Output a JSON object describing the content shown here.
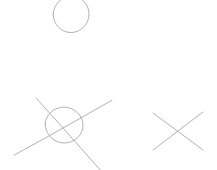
{
  "canvas": {
    "width": 217,
    "height": 170,
    "background_color": "#ffffff",
    "title": "Hand-drawn shapes sketch"
  },
  "style": {
    "stroke_color": "#a8a8ae",
    "stroke_color_light": "#b6b6bc",
    "stroke_width": 0.9
  },
  "shapes": [
    {
      "id": "top-circle",
      "name": "circle",
      "label": "Circle (clipped at top edge)",
      "cx": 71,
      "cy": 14,
      "rx": 18,
      "ry": 18.5,
      "path": "M 53.2 14.5 C 53.4 4.6 61.5 -3.7 71.2 -3.9 C 80.8 -4.1 88.8 3.9 89.0 13.7 C 89.2 23.6 81.3 32.1 71.6 32.5 C 61.8 32.9 53.4 25.0 53.2 14.5 Z"
    },
    {
      "id": "crossed-circle",
      "name": "circle-with-cross",
      "label": "Circle crossed out by two long diagonal strokes",
      "cx": 64,
      "cy": 125,
      "rx": 19,
      "ry": 18,
      "path": "M 45.2 124.0 C 45.6 114.6 54.2 107.0 64.1 107.1 C 73.9 107.2 82.6 114.8 83.0 124.6 C 83.4 134.4 74.9 142.8 64.6 143.0 C 54.3 143.2 45.4 134.9 45.2 124.0 Z"
    },
    {
      "id": "crossed-circle-line-up",
      "name": "diagonal-stroke-ascending",
      "label": "Ascending diagonal stroke through circle",
      "x1": 14,
      "y1": 155,
      "x2": 112,
      "y2": 100,
      "path": "M 14.0 155.2 L 46.0 137.6 L 80.0 118.4 L 112.0 100.2"
    },
    {
      "id": "crossed-circle-line-down",
      "name": "diagonal-stroke-descending",
      "label": "Descending diagonal stroke through circle, clipped at bottom",
      "x1": 36,
      "y1": 98,
      "x2": 102,
      "y2": 172,
      "path": "M 36.0 98.0 L 58.0 122.4 L 80.5 147.6 L 102.0 172.0"
    },
    {
      "id": "x-mark-line-a",
      "name": "x-stroke-descending",
      "label": "X mark — stroke from upper-left to lower-right",
      "x1": 153,
      "y1": 113,
      "x2": 203,
      "y2": 150,
      "path": "M 153.0 113.0 L 178.0 131.4 L 203.0 150.0"
    },
    {
      "id": "x-mark-line-b",
      "name": "x-stroke-ascending",
      "label": "X mark — stroke from upper-right to lower-left",
      "x1": 203,
      "y1": 112,
      "x2": 153,
      "y2": 150,
      "path": "M 203.0 112.0 L 178.2 130.8 L 153.0 150.0"
    }
  ]
}
